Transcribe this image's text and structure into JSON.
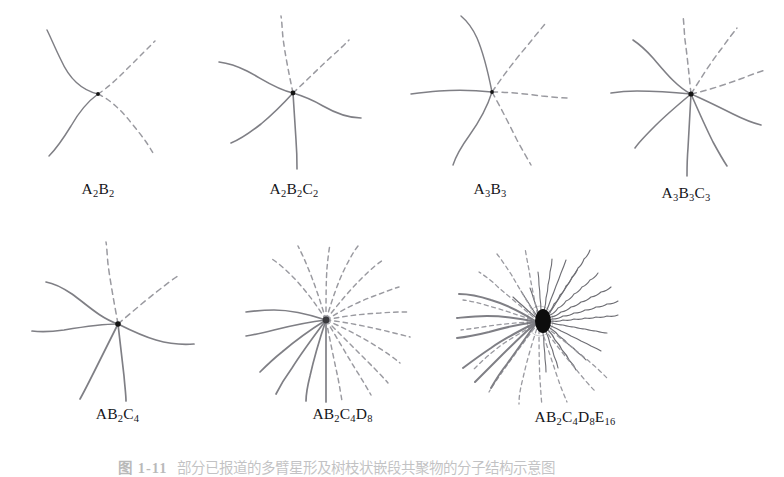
{
  "figure": {
    "background_color": "#ffffff",
    "stroke_color_solid": "#7f7f85",
    "stroke_color_dashed": "#9a9aa0",
    "stroke_color_wavy": "#6e6e74",
    "core_color": "#141414",
    "caption_label": "图 1-11",
    "caption_text": "部分已报道的多臂星形及树枝状嵌段共聚物的分子结构示意图"
  },
  "panels": [
    {
      "id": "a2b2",
      "label_parts": [
        {
          "text": "A",
          "sub": "2"
        },
        {
          "text": "B",
          "sub": "2"
        }
      ],
      "label_plain": "A2B2",
      "arms": [
        {
          "style": "solid",
          "count": 2
        },
        {
          "style": "dashed",
          "count": 2
        }
      ],
      "total_arms": 4,
      "generations": 2
    },
    {
      "id": "a2b2c2",
      "label_parts": [
        {
          "text": "A",
          "sub": "2"
        },
        {
          "text": "B",
          "sub": "2"
        },
        {
          "text": "C",
          "sub": "2"
        }
      ],
      "label_plain": "A2B2C2",
      "arms": [
        {
          "style": "solid",
          "count": 4
        },
        {
          "style": "dashed",
          "count": 2
        }
      ],
      "total_arms": 6,
      "generations": 3
    },
    {
      "id": "a3b3",
      "label_parts": [
        {
          "text": "A",
          "sub": "3"
        },
        {
          "text": "B",
          "sub": "3"
        }
      ],
      "label_plain": "A3B3",
      "arms": [
        {
          "style": "solid",
          "count": 3
        },
        {
          "style": "dashed",
          "count": 3
        }
      ],
      "total_arms": 6,
      "generations": 2
    },
    {
      "id": "a3b3c3",
      "label_parts": [
        {
          "text": "A",
          "sub": "3"
        },
        {
          "text": "B",
          "sub": "3"
        },
        {
          "text": "C",
          "sub": "3"
        }
      ],
      "label_plain": "A3B3C3",
      "arms": [
        {
          "style": "solid",
          "count": 6
        },
        {
          "style": "dashed",
          "count": 3
        }
      ],
      "total_arms": 9,
      "generations": 3
    },
    {
      "id": "ab2c4",
      "label_parts": [
        {
          "text": "A",
          "sub": ""
        },
        {
          "text": "B",
          "sub": "2"
        },
        {
          "text": "C",
          "sub": "4"
        }
      ],
      "label_plain": "AB2C4",
      "arms": [
        {
          "style": "solid",
          "count": 4
        },
        {
          "style": "dashed",
          "count": 2
        }
      ],
      "total_arms": 6,
      "generations": 3
    },
    {
      "id": "ab2c4d8",
      "label_parts": [
        {
          "text": "A",
          "sub": ""
        },
        {
          "text": "B",
          "sub": "2"
        },
        {
          "text": "C",
          "sub": "4"
        },
        {
          "text": "D",
          "sub": "8"
        }
      ],
      "label_plain": "AB2C4D8",
      "arms": [
        {
          "style": "solid",
          "count": 6
        },
        {
          "style": "dashed",
          "count": 12
        }
      ],
      "total_arms": 18,
      "generations": 4
    },
    {
      "id": "ab2c4d8e16",
      "label_parts": [
        {
          "text": "A",
          "sub": ""
        },
        {
          "text": "B",
          "sub": "2"
        },
        {
          "text": "C",
          "sub": "4"
        },
        {
          "text": "D",
          "sub": "8"
        },
        {
          "text": "E",
          "sub": "16"
        }
      ],
      "label_plain": "AB2C4D8E16",
      "arms": [
        {
          "style": "solid",
          "count": 6
        },
        {
          "style": "dashed",
          "count": 12
        },
        {
          "style": "wavy",
          "count": 18
        }
      ],
      "total_arms": 36,
      "generations": 5
    }
  ]
}
